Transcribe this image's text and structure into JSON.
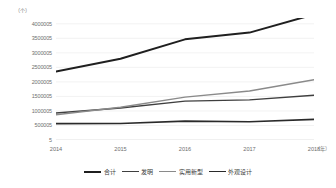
{
  "chart_data": {
    "type": "line",
    "title": "",
    "xlabel": "（年）",
    "ylabel": "（个）",
    "x": [
      "2014",
      "2015",
      "2016",
      "2017",
      "2018"
    ],
    "categories": [
      "2014",
      "2015",
      "2016",
      "2017",
      "2018"
    ],
    "ylim": [
      0,
      4200000
    ],
    "yticks": [
      0,
      500000,
      1000000,
      1500000,
      2000000,
      2500000,
      3000000,
      3500000,
      4000000
    ],
    "ytick_labels": [
      "5",
      "500005",
      "1000005",
      "1500005",
      "2000005",
      "2500005",
      "3000005",
      "3500005",
      "4000005"
    ],
    "grid": true,
    "legend_position": "bottom",
    "series": [
      {
        "name": "合计",
        "color": "#1f1f1f",
        "width": 2.0,
        "values": [
          2361243,
          2798500,
          3464824,
          3697845,
          4323000
        ]
      },
      {
        "name": "发明",
        "color": "#3f3f3f",
        "width": 1.4,
        "values": [
          928177,
          1101864,
          1338503,
          1381594,
          1542002
        ]
      },
      {
        "name": "实用新型",
        "color": "#8a8a8a",
        "width": 1.4,
        "values": [
          868511,
          1127577,
          1475977,
          1687593,
          2072311
        ]
      },
      {
        "name": "外观设计",
        "color": "#2a2a2a",
        "width": 1.6,
        "values": [
          564555,
          569059,
          650344,
          628658,
          708799
        ]
      }
    ]
  },
  "axes": {
    "y_unit_label": "（个）",
    "x_unit_label": "（年）"
  },
  "legend": {
    "items": [
      {
        "label": "合计"
      },
      {
        "label": "发明"
      },
      {
        "label": "实用新型"
      },
      {
        "label": "外观设计"
      }
    ]
  }
}
